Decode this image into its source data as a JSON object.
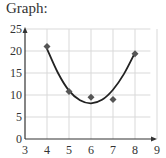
{
  "title": "Graph:",
  "chart_data": {
    "type": "scatter",
    "title": "Graph:",
    "xlabel": "",
    "ylabel": "",
    "xlim": [
      3,
      9
    ],
    "ylim": [
      0,
      25
    ],
    "x_ticks": [
      3,
      4,
      5,
      6,
      7,
      8,
      9
    ],
    "y_ticks": [
      0,
      5,
      10,
      15,
      20,
      25
    ],
    "grid": true,
    "legend": null,
    "series": [
      {
        "name": "data points",
        "kind": "scatter",
        "marker": "diamond",
        "x": [
          4,
          5,
          6,
          7,
          8
        ],
        "y": [
          21,
          10.8,
          9.5,
          9,
          19.4
        ]
      },
      {
        "name": "quadratic fit",
        "kind": "line",
        "x": [
          4,
          4.5,
          5,
          5.5,
          6,
          6.5,
          7,
          7.5,
          8
        ],
        "y": [
          20.5,
          15.0,
          11.0,
          8.8,
          8.1,
          8.9,
          11.2,
          14.8,
          19.6
        ]
      }
    ]
  },
  "colors": {
    "axis": "#333333",
    "grid": "#d9d9d9",
    "curve": "#222222",
    "marker": "#555555"
  }
}
